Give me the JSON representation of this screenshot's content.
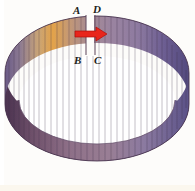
{
  "figure": {
    "kind": "geometric-diagram",
    "background_color": "#fdfcfa",
    "bottom_strip_color": "#fbf7ee"
  },
  "labels": {
    "a": "A",
    "d": "D",
    "b": "B",
    "c": "C"
  },
  "arrow": {
    "name": "red-right-arrow",
    "direction": "right",
    "color": "#e8261c",
    "outline_color": "#b01008"
  },
  "band": {
    "outer_stroke": "#4a3550",
    "inner_stroke": "#6b5570",
    "hole_color": "#ffffff",
    "rib_stroke": "#3d2d45",
    "rib_count": 48,
    "gradient_stops": [
      {
        "offset": "0%",
        "color": "#6a5a86"
      },
      {
        "offset": "8%",
        "color": "#8d7b93"
      },
      {
        "offset": "18%",
        "color": "#c9a477"
      },
      {
        "offset": "26%",
        "color": "#e3a34a"
      },
      {
        "offset": "34%",
        "color": "#c79a72"
      },
      {
        "offset": "46%",
        "color": "#a48a95"
      },
      {
        "offset": "58%",
        "color": "#9b84a0"
      },
      {
        "offset": "72%",
        "color": "#8e7ba0"
      },
      {
        "offset": "86%",
        "color": "#6e5f93"
      },
      {
        "offset": "100%",
        "color": "#534a7e"
      }
    ],
    "bottom_gradient_stops": [
      {
        "offset": "0%",
        "color": "#4b3350"
      },
      {
        "offset": "14%",
        "color": "#6d4f69"
      },
      {
        "offset": "34%",
        "color": "#8d6f87"
      },
      {
        "offset": "56%",
        "color": "#9a7f95"
      },
      {
        "offset": "76%",
        "color": "#8b7aa0"
      },
      {
        "offset": "100%",
        "color": "#5b5288"
      }
    ]
  }
}
